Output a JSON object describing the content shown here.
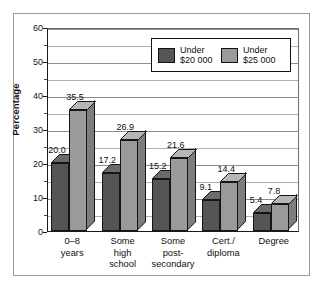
{
  "chart_data": {
    "type": "bar",
    "title": "",
    "subtitle": "",
    "xlabel": "",
    "ylabel": "Percentage",
    "ylim": [
      0,
      60
    ],
    "yticks": [
      0,
      10,
      20,
      30,
      40,
      50,
      60
    ],
    "ytick_labels": [
      "0",
      "10",
      "20",
      "30",
      "40",
      "50",
      "60"
    ],
    "minor_tick_step": 5,
    "grid": true,
    "grid_axis": "y",
    "legend_position": "top-right-inside",
    "categories": [
      "0–8 years",
      "Some high school",
      "Some post-secondary",
      "Cert./ diploma",
      "Degree"
    ],
    "category_lines": [
      [
        "0–8",
        "years"
      ],
      [
        "Some",
        "high",
        "school"
      ],
      [
        "Some",
        "post-",
        "secondary"
      ],
      [
        "Cert./",
        "diploma"
      ],
      [
        "Degree"
      ]
    ],
    "series": [
      {
        "name": "Under $20 000",
        "name_lines": [
          "Under",
          "$20 000"
        ],
        "color": "#555555",
        "values": [
          20.0,
          17.2,
          15.2,
          9.1,
          5.4
        ],
        "labels": [
          "20.0",
          "17.2",
          "15.2",
          "9.1",
          "5.4"
        ]
      },
      {
        "name": "Under $25 000",
        "name_lines": [
          "Under",
          "$25 000"
        ],
        "color": "#9a9a9a",
        "values": [
          35.5,
          26.9,
          21.6,
          14.4,
          7.8
        ],
        "labels": [
          "35.5",
          "26.9",
          "21.6",
          "14.4",
          "7.8"
        ]
      }
    ]
  },
  "colors": {
    "series_dark": "#555555",
    "series_light": "#9a9a9a",
    "series_dark_top": "#6b6b6b",
    "series_dark_side": "#3f3f3f",
    "series_light_top": "#b6b6b6",
    "series_light_side": "#7d7d7d",
    "axis": "#1a1a1a",
    "grid": "#8c8c8c",
    "frame": "#9a9a9a",
    "background": "#ffffff",
    "text": "#0f0f0f"
  }
}
